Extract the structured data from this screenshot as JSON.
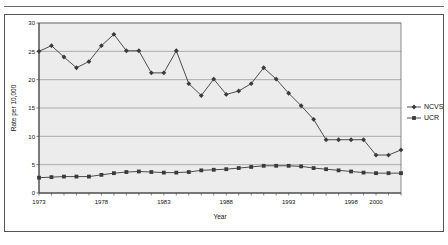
{
  "chart_data": {
    "type": "line",
    "title": "",
    "xlabel": "Year",
    "ylabel": "Rate per 10,000",
    "xlim": [
      1973,
      2002
    ],
    "ylim": [
      0,
      30
    ],
    "yticks": [
      0,
      5,
      10,
      15,
      20,
      25,
      30
    ],
    "ytick_labels": [
      "0",
      "5",
      "10",
      "15",
      "20",
      "25",
      "30"
    ],
    "xticks": [
      1973,
      1978,
      1983,
      1988,
      1993,
      1998,
      2000
    ],
    "xtick_labels": [
      "1973",
      "1978",
      "1983",
      "1988",
      "1993",
      "1998",
      "2000"
    ],
    "grid": true,
    "grid_axis": "y",
    "legend_position": "right",
    "x": [
      1973,
      1974,
      1975,
      1976,
      1977,
      1978,
      1979,
      1980,
      1981,
      1982,
      1983,
      1984,
      1985,
      1986,
      1987,
      1988,
      1989,
      1990,
      1991,
      1992,
      1993,
      1994,
      1995,
      1996,
      1997,
      1998,
      1999,
      2000,
      2001,
      2002
    ],
    "series": [
      {
        "name": "NCVS",
        "color": "#3a3a3a",
        "marker": "diamond",
        "values": [
          25.0,
          26.0,
          24.0,
          22.1,
          23.2,
          26.0,
          28.0,
          25.1,
          25.1,
          21.2,
          21.2,
          25.1,
          19.3,
          17.2,
          20.1,
          17.4,
          18.0,
          19.3,
          22.1,
          20.1,
          17.6,
          15.4,
          13.0,
          9.4,
          9.4,
          9.4,
          9.4,
          6.7,
          6.7,
          7.6
        ]
      },
      {
        "name": "UCR",
        "color": "#3a3a3a",
        "marker": "square",
        "values": [
          2.7,
          2.8,
          2.9,
          2.9,
          2.9,
          3.2,
          3.5,
          3.7,
          3.8,
          3.7,
          3.6,
          3.6,
          3.7,
          4.0,
          4.1,
          4.2,
          4.4,
          4.6,
          4.8,
          4.8,
          4.8,
          4.7,
          4.4,
          4.2,
          4.0,
          3.8,
          3.6,
          3.5,
          3.5,
          3.5
        ]
      }
    ]
  },
  "legend": {
    "entries": [
      {
        "label": "NCVS"
      },
      {
        "label": "UCR"
      }
    ]
  }
}
